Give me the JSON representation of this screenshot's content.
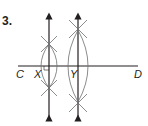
{
  "problem": {
    "number": "3."
  },
  "diagram": {
    "labels": {
      "C": "C",
      "X": "X",
      "Y": "Y",
      "D": "D"
    },
    "line_color": "#231f20",
    "arc_color": "#6d6e71"
  }
}
